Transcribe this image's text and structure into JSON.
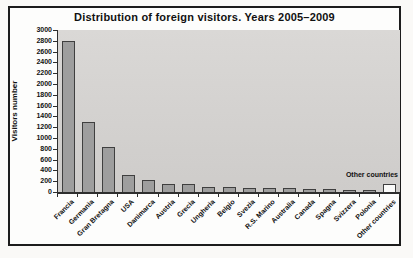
{
  "chart_data": {
    "type": "bar",
    "title": "Distribution of foreign visitors. Years 2005–2009",
    "xlabel": "",
    "ylabel": "Visitors number",
    "annotation": "Other countries",
    "categories": [
      "Francia",
      "Germania",
      "Gran Bretagna",
      "USA",
      "Danimarca",
      "Austria",
      "Grecia",
      "Ungheria",
      "Belgio",
      "Svezia",
      "R.S. Marino",
      "Australia",
      "Canada",
      "Spagna",
      "Svizzera",
      "Polonia",
      "Other countries"
    ],
    "values": [
      2800,
      1300,
      840,
      320,
      230,
      140,
      140,
      100,
      100,
      80,
      70,
      70,
      50,
      50,
      30,
      20,
      140
    ],
    "ylim": [
      0,
      3000
    ],
    "ytick_step": 200,
    "grid": false,
    "legend": "none",
    "bar_color": "#9e9e9e",
    "bar_border_color": "#3f3f3f",
    "last_bar_color": "#fbfbfa",
    "plot_bg_top": "#dad8d6",
    "plot_bg_bottom": "#ceccca",
    "axis_color": "#2e2e2e"
  }
}
